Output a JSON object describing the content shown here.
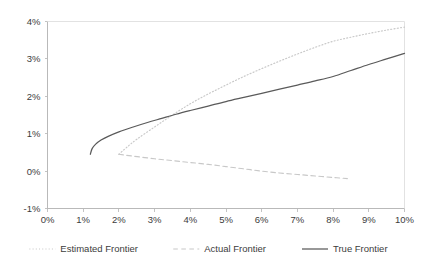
{
  "chart_data": {
    "type": "line",
    "title": "",
    "xlabel": "",
    "ylabel": "",
    "xlim": [
      0,
      10
    ],
    "ylim": [
      -1,
      4
    ],
    "grid": false,
    "legend_position": "bottom",
    "x_ticks": [
      "0%",
      "1%",
      "2%",
      "3%",
      "4%",
      "5%",
      "6%",
      "7%",
      "8%",
      "9%",
      "10%"
    ],
    "x_tick_values": [
      0,
      1,
      2,
      3,
      4,
      5,
      6,
      7,
      8,
      9,
      10
    ],
    "y_ticks": [
      "-1%",
      "0%",
      "1%",
      "2%",
      "3%",
      "4%"
    ],
    "y_tick_values": [
      -1,
      0,
      1,
      2,
      3,
      4
    ],
    "series": [
      {
        "name": "Estimated Frontier",
        "style": "dotted",
        "color": "#c8c8c8",
        "points": [
          [
            2.0,
            0.45
          ],
          [
            2.2,
            0.62
          ],
          [
            2.5,
            0.85
          ],
          [
            3.0,
            1.18
          ],
          [
            3.5,
            1.5
          ],
          [
            4.0,
            1.8
          ],
          [
            4.5,
            2.06
          ],
          [
            5.0,
            2.3
          ],
          [
            5.5,
            2.53
          ],
          [
            6.0,
            2.74
          ],
          [
            6.5,
            2.94
          ],
          [
            7.0,
            3.13
          ],
          [
            7.5,
            3.31
          ],
          [
            8.0,
            3.47
          ],
          [
            8.5,
            3.58
          ],
          [
            9.0,
            3.68
          ],
          [
            9.5,
            3.77
          ],
          [
            10.0,
            3.85
          ]
        ]
      },
      {
        "name": "Actual Frontier",
        "style": "dashed",
        "color": "#c8c8c8",
        "points": [
          [
            2.0,
            0.45
          ],
          [
            2.4,
            0.4
          ],
          [
            3.0,
            0.33
          ],
          [
            3.5,
            0.28
          ],
          [
            4.0,
            0.23
          ],
          [
            4.5,
            0.18
          ],
          [
            5.0,
            0.12
          ],
          [
            5.5,
            0.06
          ],
          [
            6.0,
            0.0
          ],
          [
            6.5,
            -0.05
          ],
          [
            7.0,
            -0.09
          ],
          [
            7.5,
            -0.13
          ],
          [
            8.0,
            -0.17
          ],
          [
            8.4,
            -0.2
          ]
        ]
      },
      {
        "name": "True Frontier",
        "style": "solid",
        "color": "#5a5a5a",
        "points": [
          [
            1.2,
            0.45
          ],
          [
            1.25,
            0.6
          ],
          [
            1.35,
            0.72
          ],
          [
            1.5,
            0.83
          ],
          [
            1.7,
            0.93
          ],
          [
            2.0,
            1.05
          ],
          [
            2.4,
            1.18
          ],
          [
            2.8,
            1.3
          ],
          [
            3.2,
            1.41
          ],
          [
            3.6,
            1.52
          ],
          [
            4.0,
            1.62
          ],
          [
            4.5,
            1.74
          ],
          [
            5.0,
            1.86
          ],
          [
            5.5,
            1.97
          ],
          [
            6.0,
            2.08
          ],
          [
            6.5,
            2.19
          ],
          [
            7.0,
            2.3
          ],
          [
            7.5,
            2.41
          ],
          [
            8.0,
            2.53
          ],
          [
            8.5,
            2.69
          ],
          [
            9.0,
            2.85
          ],
          [
            9.5,
            3.0
          ],
          [
            10.0,
            3.15
          ]
        ]
      }
    ],
    "legend": [
      {
        "label": "Estimated Frontier",
        "style": "dotted",
        "color": "#c8c8c8"
      },
      {
        "label": "Actual Frontier",
        "style": "dashed",
        "color": "#c8c8c8"
      },
      {
        "label": "True Frontier",
        "style": "solid",
        "color": "#5a5a5a"
      }
    ]
  }
}
